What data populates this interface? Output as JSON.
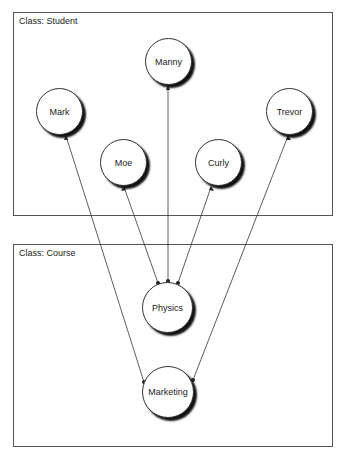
{
  "boxes": {
    "student": {
      "label": "Class: Student"
    },
    "course": {
      "label": "Class: Course"
    }
  },
  "nodes": {
    "mark": {
      "label": "Mark"
    },
    "manny": {
      "label": "Manny"
    },
    "moe": {
      "label": "Moe"
    },
    "curly": {
      "label": "Curly"
    },
    "trevor": {
      "label": "Trevor"
    },
    "physics": {
      "label": "Physics"
    },
    "marketing": {
      "label": "Marketing"
    }
  },
  "edges": [
    {
      "from": "Physics",
      "to": "Moe"
    },
    {
      "from": "Physics",
      "to": "Manny"
    },
    {
      "from": "Physics",
      "to": "Curly"
    },
    {
      "from": "Marketing",
      "to": "Mark"
    },
    {
      "from": "Marketing",
      "to": "Trevor"
    }
  ]
}
